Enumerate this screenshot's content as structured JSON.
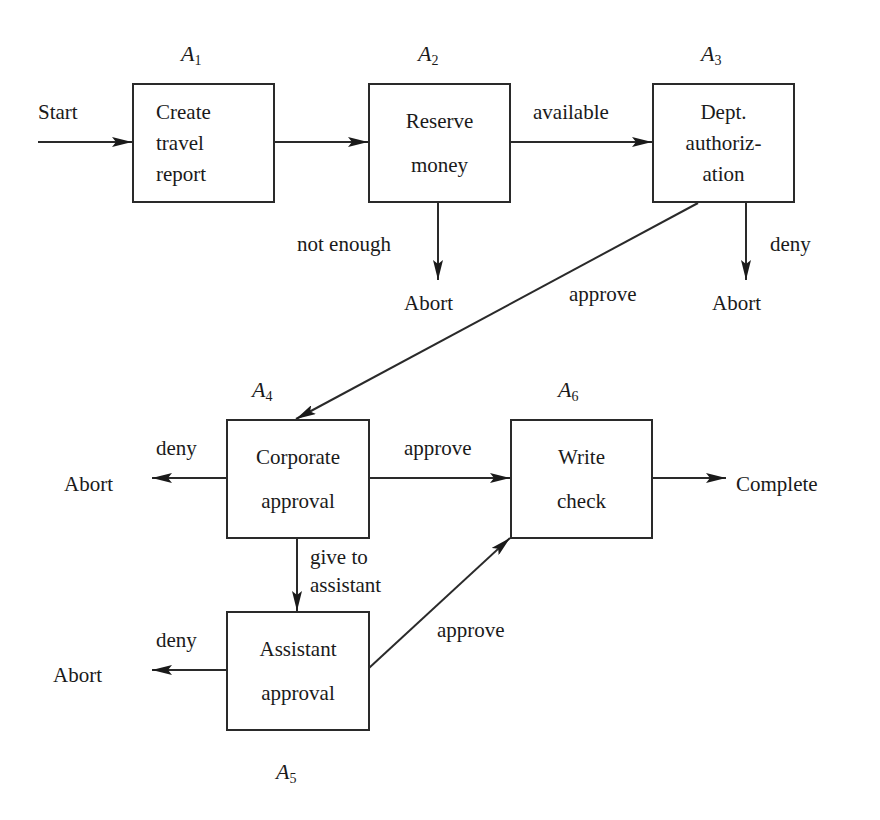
{
  "diagram": {
    "type": "workflow",
    "activities": [
      {
        "id": "A1",
        "symbol": "A",
        "sub": "1",
        "lines": [
          "Create",
          "travel",
          "report"
        ]
      },
      {
        "id": "A2",
        "symbol": "A",
        "sub": "2",
        "lines": [
          "Reserve",
          "money"
        ]
      },
      {
        "id": "A3",
        "symbol": "A",
        "sub": "3",
        "lines": [
          "Dept.",
          "authoriz-",
          "ation"
        ]
      },
      {
        "id": "A4",
        "symbol": "A",
        "sub": "4",
        "lines": [
          "Corporate",
          "approval"
        ]
      },
      {
        "id": "A5",
        "symbol": "A",
        "sub": "5",
        "lines": [
          "Assistant",
          "approval"
        ]
      },
      {
        "id": "A6",
        "symbol": "A",
        "sub": "6",
        "lines": [
          "Write",
          "check"
        ]
      }
    ],
    "terminals": {
      "start": "Start",
      "complete": "Complete",
      "abort_a2": "Abort",
      "abort_a3": "Abort",
      "abort_a4": "Abort",
      "abort_a5": "Abort"
    },
    "edge_labels": {
      "a2_to_a3": "available",
      "a2_abort": "not enough",
      "a3_abort": "deny",
      "a3_to_a4": "approve",
      "a4_abort": "deny",
      "a4_to_a6": "approve",
      "a4_to_a5": [
        "give to",
        "assistant"
      ],
      "a5_abort": "deny",
      "a5_to_a6": "approve"
    },
    "edges": [
      {
        "from": "Start",
        "to": "A1",
        "label": ""
      },
      {
        "from": "A1",
        "to": "A2",
        "label": ""
      },
      {
        "from": "A2",
        "to": "A3",
        "label": "available"
      },
      {
        "from": "A2",
        "to": "Abort",
        "label": "not enough"
      },
      {
        "from": "A3",
        "to": "Abort",
        "label": "deny"
      },
      {
        "from": "A3",
        "to": "A4",
        "label": "approve"
      },
      {
        "from": "A4",
        "to": "Abort",
        "label": "deny"
      },
      {
        "from": "A4",
        "to": "A6",
        "label": "approve"
      },
      {
        "from": "A4",
        "to": "A5",
        "label": "give to assistant"
      },
      {
        "from": "A5",
        "to": "Abort",
        "label": "deny"
      },
      {
        "from": "A5",
        "to": "A6",
        "label": "approve"
      },
      {
        "from": "A6",
        "to": "Complete",
        "label": ""
      }
    ]
  }
}
